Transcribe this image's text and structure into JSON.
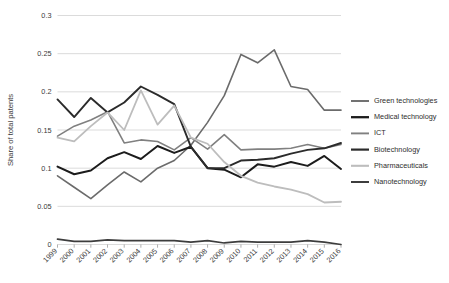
{
  "chart_data": {
    "type": "line",
    "title": "",
    "xlabel": "",
    "ylabel": "Share of total patents",
    "ylim": [
      0,
      0.3
    ],
    "yticks": [
      "0",
      "0.05",
      "0.1",
      "0.15",
      "0.2",
      "0.25",
      "0.3"
    ],
    "ytick_values": [
      0,
      0.05,
      0.1,
      0.15,
      0.2,
      0.25,
      0.3
    ],
    "grid": true,
    "legend_position": "right",
    "categories": [
      "1999",
      "2000",
      "2001",
      "2002",
      "2003",
      "2004",
      "2005",
      "2006",
      "2007",
      "2008",
      "2009",
      "2010",
      "2011",
      "2012",
      "2013",
      "2014",
      "2015",
      "2016"
    ],
    "series": [
      {
        "name": "Green technologies",
        "color": "#6b6b6b",
        "width": 1.6,
        "values": [
          0.09,
          0.075,
          0.06,
          0.078,
          0.095,
          0.082,
          0.1,
          0.11,
          0.13,
          0.16,
          0.195,
          0.249,
          0.238,
          0.255,
          0.207,
          0.203,
          0.176,
          0.176
        ]
      },
      {
        "name": "Medical technology",
        "color": "#1c1c1c",
        "width": 2.0,
        "values": [
          0.102,
          0.092,
          0.097,
          0.113,
          0.121,
          0.112,
          0.129,
          0.12,
          0.128,
          0.1,
          0.098,
          0.088,
          0.105,
          0.102,
          0.108,
          0.103,
          0.116,
          0.099
        ]
      },
      {
        "name": "ICT",
        "color": "#808080",
        "width": 1.6,
        "values": [
          0.142,
          0.155,
          0.163,
          0.174,
          0.133,
          0.137,
          0.135,
          0.124,
          0.14,
          0.125,
          0.144,
          0.124,
          0.125,
          0.125,
          0.126,
          0.131,
          0.126,
          0.131
        ]
      },
      {
        "name": "Biotechnology",
        "color": "#2b2b2b",
        "width": 1.9,
        "values": [
          0.19,
          0.167,
          0.192,
          0.173,
          0.186,
          0.207,
          0.196,
          0.184,
          0.128,
          0.1,
          0.1,
          0.11,
          0.111,
          0.113,
          0.119,
          0.124,
          0.126,
          0.133
        ]
      },
      {
        "name": "Pharmaceuticals",
        "color": "#bdbdbd",
        "width": 1.8,
        "values": [
          0.14,
          0.135,
          0.155,
          0.173,
          0.15,
          0.202,
          0.157,
          0.182,
          0.14,
          0.132,
          0.108,
          0.09,
          0.081,
          0.076,
          0.072,
          0.066,
          0.055,
          0.056
        ]
      },
      {
        "name": "Nanotechnology",
        "color": "#3d3d3d",
        "width": 1.7,
        "values": [
          0.007,
          0.004,
          0.004,
          0.006,
          0.005,
          0.005,
          0.005,
          0.005,
          0.003,
          0.005,
          0.002,
          0.004,
          0.003,
          0.003,
          0.003,
          0.005,
          0.003,
          0.0
        ]
      }
    ]
  },
  "legend": {
    "items": [
      {
        "label": "Green technologies"
      },
      {
        "label": "Medical technology"
      },
      {
        "label": "ICT"
      },
      {
        "label": "Biotechnology"
      },
      {
        "label": "Pharmaceuticals"
      },
      {
        "label": "Nanotechnology"
      }
    ]
  },
  "axes": {
    "y_title": "Share of total patents"
  }
}
